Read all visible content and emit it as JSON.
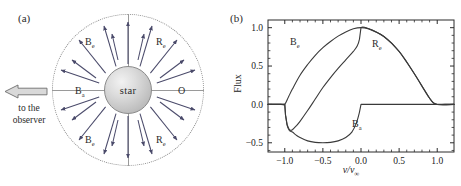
{
  "figure": {
    "panel_a": {
      "label": "(a)",
      "star_label": "star",
      "observer_text_line1": "to the",
      "observer_text_line2": "observer",
      "observer_arrow_direction": "left",
      "regions": [
        {
          "id": "be-top",
          "label": "B",
          "sub": "e",
          "quadrant": "upper-left"
        },
        {
          "id": "re-top",
          "label": "R",
          "sub": "e",
          "quadrant": "upper-right"
        },
        {
          "id": "ba",
          "label": "B",
          "sub": "a",
          "quadrant": "middle-left"
        },
        {
          "id": "o",
          "label": "O",
          "sub": "",
          "quadrant": "middle-right"
        },
        {
          "id": "be-bot",
          "label": "B",
          "sub": "e",
          "quadrant": "lower-left"
        },
        {
          "id": "re-bot",
          "label": "R",
          "sub": "e",
          "quadrant": "lower-right"
        }
      ],
      "colors": {
        "outer_circle": "#8d8d8d",
        "divider": "#9a9a9a",
        "arrow": "#4a4a6a",
        "star_edge": "#8a8a8a"
      }
    },
    "panel_b": {
      "label": "(b)",
      "curve_labels": [
        {
          "id": "be",
          "label": "B",
          "sub": "e"
        },
        {
          "id": "re",
          "label": "R",
          "sub": "e"
        },
        {
          "id": "ba",
          "label": "B",
          "sub": "a"
        }
      ]
    }
  },
  "chart_data": {
    "type": "line",
    "title": "",
    "xlabel": "v/v∞",
    "ylabel": "Flux",
    "xlim": [
      -1.22,
      1.22
    ],
    "ylim": [
      -0.62,
      1.1
    ],
    "xticks": [
      -1.0,
      -0.5,
      0.0,
      0.5,
      1.0
    ],
    "xticklabels": [
      "−1.0",
      "−0.5",
      "0.0",
      "0.5",
      "1.0"
    ],
    "yticks": [
      -0.5,
      0.0,
      0.5,
      1.0
    ],
    "yticklabels": [
      "−0.5",
      "0.0",
      "0.5",
      "1.0"
    ],
    "grid": false,
    "legend": "none",
    "annotations": [
      {
        "text": "B_e",
        "x": -0.62,
        "y": 0.75
      },
      {
        "text": "R_e",
        "x": 0.42,
        "y": 0.72
      },
      {
        "text": "B_a",
        "x": 0.12,
        "y": -0.33
      }
    ],
    "series": [
      {
        "name": "Emission envelope (B_e + R_e)",
        "comment": "symmetric emission peaking at line centre",
        "x": [
          -1.22,
          -1.05,
          -1.0,
          -0.95,
          -0.9,
          -0.8,
          -0.7,
          -0.6,
          -0.5,
          -0.4,
          -0.3,
          -0.2,
          -0.1,
          0.0,
          0.1,
          0.2,
          0.3,
          0.4,
          0.5,
          0.6,
          0.7,
          0.8,
          0.9,
          0.95,
          1.0,
          1.1,
          1.22
        ],
        "y": [
          0.0,
          0.0,
          0.0,
          0.1,
          0.2,
          0.38,
          0.52,
          0.64,
          0.74,
          0.82,
          0.89,
          0.945,
          0.985,
          1.0,
          0.985,
          0.945,
          0.885,
          0.8,
          0.69,
          0.55,
          0.4,
          0.24,
          0.08,
          0.02,
          0.0,
          0.0,
          0.0
        ]
      },
      {
        "name": "Absorption trough (B_a)",
        "comment": "blue-shifted absorption, zero outside -1..0",
        "x": [
          -1.22,
          -1.02,
          -1.0,
          -0.99,
          -0.97,
          -0.94,
          -0.9,
          -0.85,
          -0.8,
          -0.7,
          -0.6,
          -0.5,
          -0.4,
          -0.3,
          -0.2,
          -0.12,
          -0.06,
          -0.02,
          0.0,
          0.02,
          0.5,
          1.22
        ],
        "y": [
          0.0,
          0.0,
          0.0,
          -0.14,
          -0.27,
          -0.34,
          -0.36,
          -0.4,
          -0.43,
          -0.475,
          -0.495,
          -0.5,
          -0.495,
          -0.475,
          -0.43,
          -0.36,
          -0.24,
          -0.1,
          0.0,
          0.0,
          0.0,
          0.0
        ]
      },
      {
        "name": "Total P Cygni profile",
        "comment": "emission plus absorption; sharp rise to 1.0 at line centre",
        "x": [
          -1.22,
          -1.02,
          -1.0,
          -0.99,
          -0.97,
          -0.95,
          -0.92,
          -0.9,
          -0.85,
          -0.8,
          -0.7,
          -0.6,
          -0.5,
          -0.4,
          -0.3,
          -0.2,
          -0.1,
          -0.05,
          -0.02,
          0.0,
          0.1,
          0.3,
          0.5,
          0.7,
          0.9,
          1.0,
          1.22
        ],
        "y": [
          0.0,
          0.0,
          0.0,
          -0.14,
          -0.26,
          -0.31,
          -0.34,
          -0.33,
          -0.28,
          -0.22,
          -0.08,
          0.07,
          0.22,
          0.35,
          0.47,
          0.58,
          0.69,
          0.76,
          0.85,
          1.0,
          0.985,
          0.885,
          0.69,
          0.4,
          0.08,
          0.0,
          0.0
        ]
      }
    ]
  }
}
